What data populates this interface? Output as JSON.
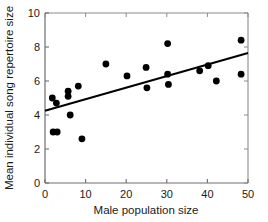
{
  "chart_data": {
    "type": "scatter",
    "title": "",
    "xlabel": "Male population size",
    "ylabel": "Mean individual song repertoire size",
    "xlim": [
      0,
      50
    ],
    "ylim": [
      0,
      10
    ],
    "xticks": [
      0,
      10,
      20,
      30,
      40,
      50
    ],
    "yticks": [
      0,
      2,
      4,
      6,
      8,
      10
    ],
    "xtick_labels": [
      "0",
      "10",
      "20",
      "30",
      "40",
      "50"
    ],
    "ytick_labels": [
      "0",
      "2",
      "4",
      "6",
      "8",
      "10"
    ],
    "grid": false,
    "legend": null,
    "marker": {
      "shape": "circle",
      "color": "#000000",
      "size": 4.6
    },
    "points": [
      {
        "x": 1.8,
        "y": 5.0
      },
      {
        "x": 2.0,
        "y": 3.0
      },
      {
        "x": 3.0,
        "y": 3.0
      },
      {
        "x": 2.8,
        "y": 4.7
      },
      {
        "x": 5.7,
        "y": 5.4
      },
      {
        "x": 5.7,
        "y": 5.1
      },
      {
        "x": 6.2,
        "y": 4.0
      },
      {
        "x": 8.2,
        "y": 5.7
      },
      {
        "x": 9.1,
        "y": 2.6
      },
      {
        "x": 15.0,
        "y": 7.0
      },
      {
        "x": 20.2,
        "y": 6.3
      },
      {
        "x": 24.9,
        "y": 6.8
      },
      {
        "x": 25.1,
        "y": 5.6
      },
      {
        "x": 30.2,
        "y": 8.2
      },
      {
        "x": 30.2,
        "y": 6.4
      },
      {
        "x": 30.4,
        "y": 5.8
      },
      {
        "x": 38.1,
        "y": 6.6
      },
      {
        "x": 40.2,
        "y": 6.9
      },
      {
        "x": 42.2,
        "y": 6.0
      },
      {
        "x": 48.3,
        "y": 8.4
      },
      {
        "x": 48.3,
        "y": 6.4
      }
    ],
    "trendline": {
      "type": "linear-fit",
      "color": "#000000",
      "width": 2.0,
      "x_start": 0.0,
      "y_start": 4.25,
      "x_end": 50.0,
      "y_end": 7.65
    },
    "axes": {
      "line_color": "#808080",
      "box": false,
      "spines": [
        "left",
        "bottom",
        "top",
        "right"
      ],
      "tick_direction": "in"
    }
  }
}
